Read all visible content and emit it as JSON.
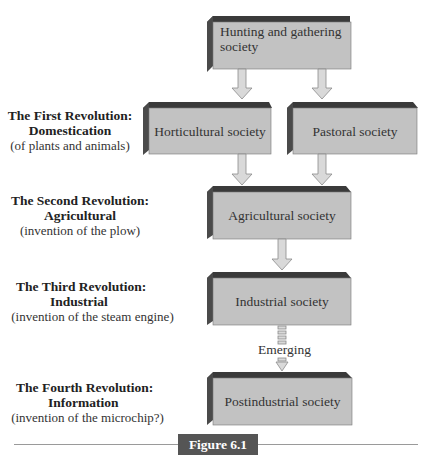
{
  "diagram": {
    "nodes": {
      "hunting": "Hunting and gathering society",
      "hunting_line1": "Hunting and gathering",
      "hunting_line2": "society",
      "horticultural": "Horticultural society",
      "pastoral": "Pastoral society",
      "agricultural": "Agricultural society",
      "industrial": "Industrial society",
      "postindustrial": "Postindustrial society"
    },
    "emerging_label": "Emerging",
    "revolutions": [
      {
        "title1": "The First Revolution:",
        "title2": "Domestication",
        "subtitle": "(of plants and animals)"
      },
      {
        "title1": "The Second Revolution:",
        "title2": "Agricultural",
        "subtitle": "(invention of the plow)"
      },
      {
        "title1": "The Third Revolution:",
        "title2": "Industrial",
        "subtitle": "(invention of the steam engine)"
      },
      {
        "title1": "The Fourth Revolution:",
        "title2": "Information",
        "subtitle": "(invention of the microchip?)"
      }
    ],
    "edges": [
      {
        "from": "hunting",
        "to": "horticultural",
        "style": "solid"
      },
      {
        "from": "hunting",
        "to": "pastoral",
        "style": "solid"
      },
      {
        "from": "horticultural",
        "to": "agricultural",
        "style": "solid"
      },
      {
        "from": "pastoral",
        "to": "agricultural",
        "style": "solid"
      },
      {
        "from": "agricultural",
        "to": "industrial",
        "style": "solid"
      },
      {
        "from": "industrial",
        "to": "postindustrial",
        "style": "dashed",
        "label": "Emerging"
      }
    ],
    "colors": {
      "box_face": "#c2c2c2",
      "box_top": "#3a3a3a",
      "box_side": "#4a4a4a",
      "arrow_fill": "#d9d9d9",
      "arrow_stroke": "#8a8a8a"
    }
  },
  "caption": "Figure 6.1"
}
